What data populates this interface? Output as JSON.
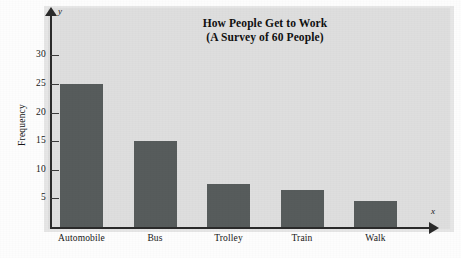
{
  "chart_data": {
    "type": "bar",
    "title": "How People Get to Work",
    "subtitle": "(A Survey of 60 People)",
    "categories": [
      "Automobile",
      "Bus",
      "Trolley",
      "Train",
      "Walk"
    ],
    "values": [
      25,
      15,
      7.5,
      6.5,
      4.5
    ],
    "xlabel": "",
    "ylabel": "Frequency",
    "x_axis_letter": "x",
    "y_axis_letter": "y",
    "ylim": [
      0,
      33
    ],
    "yticks": [
      5,
      10,
      15,
      20,
      25,
      30
    ],
    "ytick_labels": [
      "5",
      "10",
      "15",
      "20",
      "25",
      "30"
    ],
    "grid": false,
    "legend": false,
    "bar_color": "#575c5c",
    "background_color": "#dedede",
    "axis_color": "#2a2a2a"
  }
}
